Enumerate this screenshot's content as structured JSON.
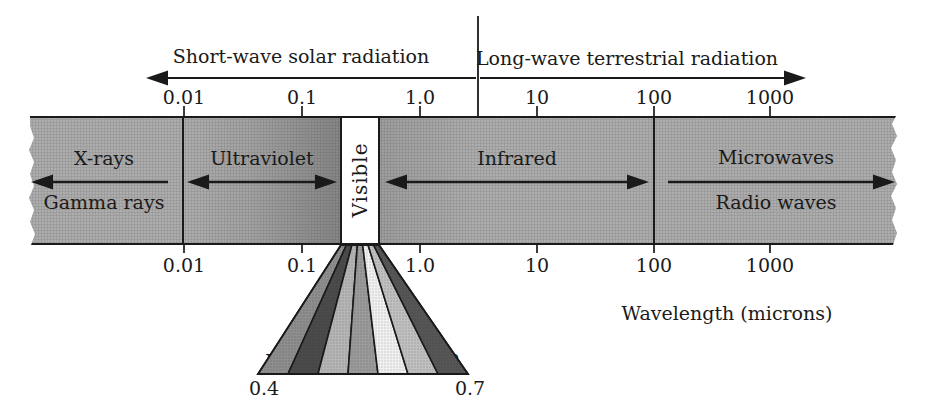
{
  "header": {
    "short_wave_label": "Short-wave solar radiation",
    "long_wave_label": "Long-wave terrestrial radiation"
  },
  "scale": {
    "top_ticks": [
      "0.01",
      "0.1",
      "1.0",
      "10",
      "100",
      "1000"
    ],
    "bottom_ticks": [
      "0.01",
      "0.1",
      "1.0",
      "10",
      "100",
      "1000"
    ],
    "axis_title": "Wavelength (microns)"
  },
  "regions": {
    "xray": "X-rays",
    "gamma": "Gamma rays",
    "ultraviolet": "Ultraviolet",
    "visible": "Visible",
    "infrared": "Infrared",
    "microwaves": "Microwaves",
    "radio": "Radio waves"
  },
  "visible_fan": {
    "stripes": [
      {
        "label": "V",
        "name": "violet",
        "color": "#8e8e8e"
      },
      {
        "label": "I",
        "name": "indigo",
        "color": "#4b4b4b"
      },
      {
        "label": "B",
        "name": "blue",
        "color": "#b5b5b5"
      },
      {
        "label": "G",
        "name": "green",
        "color": "#9b9b9b"
      },
      {
        "label": "Y",
        "name": "yellow",
        "color": "#f0f0f0"
      },
      {
        "label": "O",
        "name": "orange",
        "color": "#c0c0c0"
      },
      {
        "label": "R",
        "name": "red",
        "color": "#565656"
      }
    ],
    "min_wavelength": "0.4",
    "max_wavelength": "0.7"
  },
  "colors": {
    "background": "#ffffff",
    "band_gray": "#b4b4b4",
    "uv_dark_gray": "#8b8b8b",
    "visible_white": "#ffffff",
    "line_black": "#1a1a1a"
  }
}
